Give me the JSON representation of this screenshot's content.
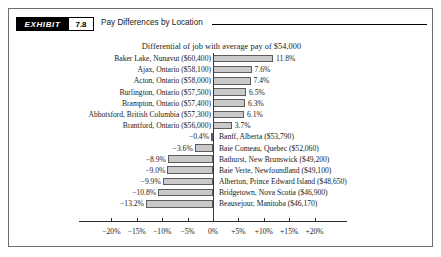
{
  "header": {
    "badge": "EXHIBIT",
    "number": "7.8",
    "title": "Pay Differences by Location"
  },
  "subtitle": "Differential of job with average pay of $54,000",
  "chart_data": {
    "type": "bar",
    "orientation": "horizontal",
    "title": "Pay Differences by Location",
    "subtitle": "Differential of job with average pay of $54,000",
    "xlabel": "",
    "ylabel": "",
    "xlim": [
      -20,
      20
    ],
    "grid": false,
    "legend": false,
    "reference_value": 54000,
    "tick_labels": [
      "−20%",
      "−15%",
      "−10%",
      "−5%",
      "0%",
      "+5%",
      "+10%",
      "+15%",
      "+20%"
    ],
    "tick_values": [
      -20,
      -15,
      -10,
      -5,
      0,
      5,
      10,
      15,
      20
    ],
    "categories": [
      "Baker Lake, Nunavut ($60,400)",
      "Ajax, Ontario ($58,100)",
      "Acton, Ontario ($58,000)",
      "Burlington, Ontario ($57,500)",
      "Brampton, Ontario ($57,400)",
      "Abbotsford, British Columbia ($57,300)",
      "Brantford, Ontario ($56,000)",
      "Banff, Alberta ($53,790)",
      "Baie Comeau, Quebec ($52,060)",
      "Bathurst, New Brunswick ($49,200)",
      "Baie Verte, Newfoundland ($49,100)",
      "Alberton, Prince Edward Island ($48,650)",
      "Bridgetown, Nova Scotia ($46,900)",
      "Beausejour, Manitoba ($46,170)"
    ],
    "values": [
      11.8,
      7.6,
      7.4,
      6.5,
      6.3,
      6.1,
      3.7,
      -0.4,
      -3.6,
      -8.9,
      -9.0,
      -9.9,
      -10.8,
      -13.2
    ],
    "value_labels": [
      "11.8%",
      "7.6%",
      "7.4%",
      "6.5%",
      "6.3%",
      "6.1%",
      "3.7%",
      "−0.4%",
      "−3.6%",
      "−8.9%",
      "−9.0%",
      "−9.9%",
      "−10.8%",
      "−13.2%"
    ],
    "bar_fill": "#c9c9c9",
    "bar_stroke": "#5d5d5d"
  }
}
